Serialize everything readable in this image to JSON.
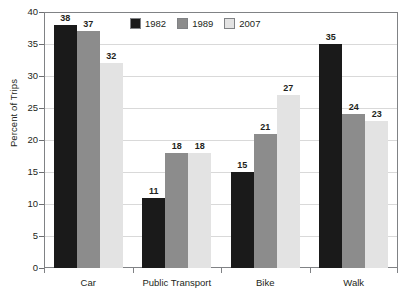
{
  "chart_data": {
    "type": "bar",
    "title": "",
    "subtitle": "",
    "xlabel": "",
    "ylabel": "Percent of Trips",
    "categories": [
      "Car",
      "Public Transport",
      "Bike",
      "Walk"
    ],
    "series": [
      {
        "name": "1982",
        "color": "#1a1a1a",
        "values": [
          38,
          11,
          15,
          35
        ]
      },
      {
        "name": "1989",
        "color": "#8c8c8c",
        "values": [
          37,
          18,
          21,
          24
        ]
      },
      {
        "name": "2007",
        "color": "#e3e3e3",
        "values": [
          32,
          18,
          27,
          23
        ]
      }
    ],
    "ylim": [
      0,
      40
    ],
    "ytick_values": [
      0,
      5,
      10,
      15,
      20,
      25,
      30,
      35,
      40
    ],
    "ytick_labels": [
      "0",
      "5",
      "10",
      "15",
      "20",
      "25",
      "30",
      "35",
      "40"
    ],
    "grid": true,
    "grid_axis": "y",
    "legend_position": "top-left-inside",
    "data_labels": true,
    "colors": {
      "background": "#ffffff",
      "plot_border": "#808285",
      "gridline": "#d9d9d9",
      "tick": "#6d6e71",
      "text": "#231f20"
    }
  }
}
